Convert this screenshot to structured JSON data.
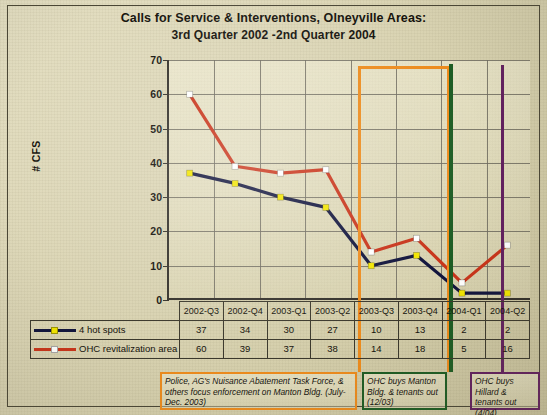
{
  "title": {
    "line1": "Calls for Service & Interventions, Olneyville Areas:",
    "line2": "3rd Quarter 2002 -2nd Quarter 2004"
  },
  "chart_data": {
    "type": "line",
    "title": "Calls for Service & Interventions, Olneyville Areas: 3rd Quarter 2002 -2nd Quarter 2004",
    "xlabel": "",
    "ylabel": "# CFS",
    "ylim": [
      0,
      70
    ],
    "ytick_step": 10,
    "yticks": [
      "0",
      "10",
      "20",
      "30",
      "40",
      "50",
      "60",
      "70"
    ],
    "grid": true,
    "legend_position": "table-left",
    "categories": [
      "2002-Q3",
      "2002-Q4",
      "2003-Q1",
      "2003-Q2",
      "2003-Q3",
      "2003-Q4",
      "2004-Q1",
      "2004-Q2"
    ],
    "series": [
      {
        "name": "4 hot spots",
        "values": [
          37,
          34,
          30,
          27,
          10,
          13,
          2,
          2
        ],
        "line_color": "#11143c",
        "marker_color": "#f2e500",
        "marker": "square"
      },
      {
        "name": "OHC revitalization area",
        "values": [
          60,
          39,
          37,
          38,
          14,
          18,
          5,
          16
        ],
        "line_color": "#c8341a",
        "marker_color": "#ffffff",
        "marker": "square"
      }
    ],
    "annotations": [
      {
        "id": "enforcement",
        "text": "Police, AG's Nuisance Abatement Task Force, & others focus enforcement on Manton Bldg. (July-Dec. 2003)",
        "color": "#ec8b1d",
        "shape": "bracket",
        "span_categories": [
          "2003-Q3",
          "2003-Q4"
        ]
      },
      {
        "id": "manton",
        "text": "OHC buys Manton Bldg. & tenants out (12/03)",
        "color": "#1d5c23",
        "shape": "vertical-line",
        "at_category": "2004-Q1"
      },
      {
        "id": "hillard",
        "text": "OHC buys Hillard & tenants out (4/04)",
        "color": "#62205f",
        "shape": "vertical-line",
        "at_category": "2004-Q2"
      }
    ]
  },
  "table": {
    "header": [
      "2002-Q3",
      "2002-Q4",
      "2003-Q1",
      "2003-Q2",
      "2003-Q3",
      "2003-Q4",
      "2004-Q1",
      "2004-Q2"
    ],
    "rows": [
      {
        "label": "4 hot spots",
        "values": [
          "37",
          "34",
          "30",
          "27",
          "10",
          "13",
          "2",
          "2"
        ]
      },
      {
        "label": "OHC revitalization area",
        "values": [
          "60",
          "39",
          "37",
          "38",
          "14",
          "18",
          "5",
          "16"
        ]
      }
    ]
  },
  "notes": {
    "enforcement": "Police, AG's Nuisance Abatement Task Force, & others focus enforcement on Manton Bldg. (July-Dec. 2003)",
    "manton": "OHC buys Manton Bldg. & tenants out (12/03)",
    "hillard": "OHC buys Hillard & tenants out (4/04)"
  },
  "colors": {
    "series1_line": "#11143c",
    "series1_marker": "#f2e500",
    "series2_line": "#c8341a",
    "series2_marker": "#ffffff",
    "orange": "#ec8b1d",
    "green": "#1d5c23",
    "purple": "#62205f"
  }
}
